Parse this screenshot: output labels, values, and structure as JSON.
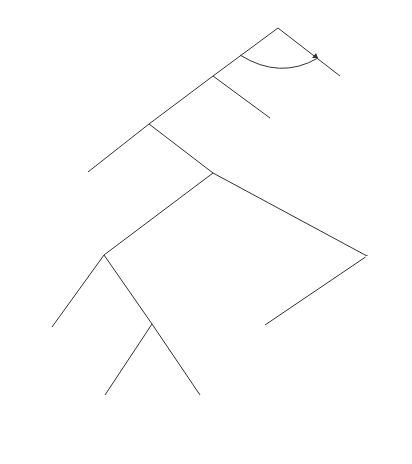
{
  "nodes": {
    "root": {
      "label": "D"
    },
    "a1": {
      "label": "A₁"
    },
    "d2": {
      "label": "D"
    },
    "g1": {
      "label": "G₁"
    },
    "nature": {
      "label": "N"
    },
    "g2_left": {
      "label": "G₂"
    },
    "g2_right": {
      "label": "G₂"
    },
    "t1_arc": {
      "label": "t₁"
    }
  },
  "branches": {
    "invest": "Invest",
    "not_invest": "Not Invest",
    "honor": "Honor",
    "renege": "Renege",
    "g1_enforce": "Enforce",
    "g1_not_enforce": "Not Enforce",
    "success": "s = Pr(Success)",
    "failure": "1−s",
    "g2l_enforce": "Enforce",
    "g2l_not_enforce": "Not Enforce",
    "g2r_enforce": "Enforce",
    "g2r_not_enforce": "Not Enforce"
  },
  "payoffs": {
    "not_invest": [
      "−C̃D",
      "v₁",
      "0",
      "0"
    ],
    "honor": [
      "t₁R₁−C̃D",
      "(1−t−b)R₁",
      "bR₁",
      "0"
    ],
    "success": [
      "R₁−C̃D−ρ₁",
      "(1−b−t)R₁",
      "bR₁−c",
      "0"
    ],
    "g2l_enforce": [
      "R₁+(1−t)R₂−C̃D−ρ₁−ρ₂",
      "0",
      "bR₁−c",
      "−c"
    ],
    "g2l_not_enforce": [
      "R₁+(1−t)R₂−C̃D−ρ₁",
      "0",
      "−c−bR₂",
      "−bR₂"
    ],
    "g2r_enforce": [
      "R₁+(1−t)R₂−C̃D−ρ₂",
      "0",
      "−bR₂",
      "bR₂−c"
    ],
    "g2r_not_enforce": [
      "R₁+(1−t)R₂−C̃D",
      "0",
      "−bR₂",
      "−bR₂"
    ]
  }
}
